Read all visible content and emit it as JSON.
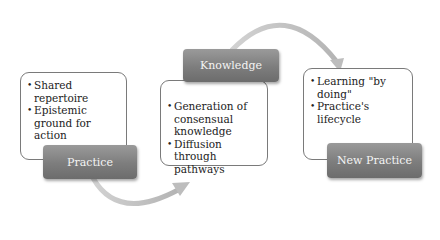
{
  "diagram": {
    "stages": [
      {
        "title": "Practice",
        "bullets": [
          "Shared repertoire",
          "Epistemic ground for action"
        ]
      },
      {
        "title": "Knowledge",
        "bullets": [
          "Generation of consensual knowledge",
          "Diffusion through pathways"
        ]
      },
      {
        "title": "New Practice",
        "bullets": [
          "Learning \"by doing\"",
          "Practice's lifecycle"
        ]
      }
    ],
    "colors": {
      "label_fill": "#7d7d7d",
      "label_text": "#f4f4f4",
      "box_border": "#7a7a7a",
      "arrow": "#c4c4c4"
    }
  }
}
